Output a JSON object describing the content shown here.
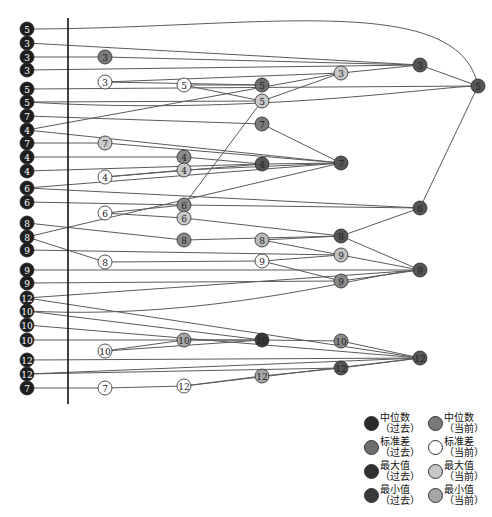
{
  "diagram": {
    "type": "tanglegram-node-link",
    "axis_line": {
      "x": 68,
      "y1": 18,
      "y2": 404
    },
    "colors": {
      "median_past": "#2b2b2b",
      "median_now": "#7a7a7a",
      "std_past": "#6e6e6e",
      "std_now": "#ffffff",
      "max_past": "#303030",
      "max_now": "#c8c8c8",
      "min_past": "#3a3a3a",
      "min_now": "#a6a6a6",
      "left_node": "#1e1e1e",
      "edge": "#5a5a5a"
    },
    "left_nodes": [
      {
        "id": "L1",
        "label": "5",
        "y": 29
      },
      {
        "id": "L2",
        "label": "3",
        "y": 43
      },
      {
        "id": "L3",
        "label": "3",
        "y": 57
      },
      {
        "id": "L4",
        "label": "3",
        "y": 70
      },
      {
        "id": "L5",
        "label": "5",
        "y": 89
      },
      {
        "id": "L6",
        "label": "5",
        "y": 102
      },
      {
        "id": "L7",
        "label": "7",
        "y": 116
      },
      {
        "id": "L8",
        "label": "4",
        "y": 130
      },
      {
        "id": "L9",
        "label": "7",
        "y": 143
      },
      {
        "id": "L10",
        "label": "4",
        "y": 157
      },
      {
        "id": "L11",
        "label": "4",
        "y": 171
      },
      {
        "id": "L12",
        "label": "6",
        "y": 188
      },
      {
        "id": "L13",
        "label": "6",
        "y": 202
      },
      {
        "id": "L14",
        "label": "8",
        "y": 223
      },
      {
        "id": "L15",
        "label": "8",
        "y": 237
      },
      {
        "id": "L16",
        "label": "9",
        "y": 250
      },
      {
        "id": "L17",
        "label": "9",
        "y": 270
      },
      {
        "id": "L18",
        "label": "9",
        "y": 283
      },
      {
        "id": "L19",
        "label": "12",
        "y": 298
      },
      {
        "id": "L20",
        "label": "10",
        "y": 311
      },
      {
        "id": "L21",
        "label": "10",
        "y": 325
      },
      {
        "id": "L22",
        "label": "10",
        "y": 340
      },
      {
        "id": "L23",
        "label": "12",
        "y": 360
      },
      {
        "id": "L24",
        "label": "12",
        "y": 374
      },
      {
        "id": "L25",
        "label": "7",
        "y": 388
      }
    ],
    "nodes": [
      {
        "id": "A1",
        "label": "3",
        "x": 105,
        "y": 57,
        "fill": "#7a7a7a"
      },
      {
        "id": "A2",
        "label": "3",
        "x": 105,
        "y": 82,
        "fill": "#ffffff"
      },
      {
        "id": "A3",
        "label": "7",
        "x": 105,
        "y": 143,
        "fill": "#c8c8c8"
      },
      {
        "id": "A4",
        "label": "4",
        "x": 105,
        "y": 177,
        "fill": "#ffffff"
      },
      {
        "id": "A5",
        "label": "6",
        "x": 105,
        "y": 213,
        "fill": "#ffffff"
      },
      {
        "id": "A6",
        "label": "8",
        "x": 105,
        "y": 262,
        "fill": "#ffffff"
      },
      {
        "id": "A7",
        "label": "10",
        "x": 105,
        "y": 351,
        "fill": "#ffffff"
      },
      {
        "id": "A8",
        "label": "7",
        "x": 105,
        "y": 388,
        "fill": "#ffffff"
      },
      {
        "id": "B1",
        "label": "5",
        "x": 184,
        "y": 85,
        "fill": "#ffffff"
      },
      {
        "id": "B2",
        "label": "4",
        "x": 184,
        "y": 157,
        "fill": "#8a8a8a"
      },
      {
        "id": "B3",
        "label": "4",
        "x": 184,
        "y": 170,
        "fill": "#c8c8c8"
      },
      {
        "id": "B4",
        "label": "6",
        "x": 184,
        "y": 205,
        "fill": "#8a8a8a"
      },
      {
        "id": "B5",
        "label": "6",
        "x": 184,
        "y": 218,
        "fill": "#c8c8c8"
      },
      {
        "id": "B6",
        "label": "8",
        "x": 184,
        "y": 240,
        "fill": "#8a8a8a"
      },
      {
        "id": "B7",
        "label": "10",
        "x": 184,
        "y": 340,
        "fill": "#a6a6a6"
      },
      {
        "id": "B8",
        "label": "12",
        "x": 184,
        "y": 386,
        "fill": "#ffffff"
      },
      {
        "id": "C1",
        "label": "5",
        "x": 262,
        "y": 85,
        "fill": "#6e6e6e"
      },
      {
        "id": "C2",
        "label": "5",
        "x": 262,
        "y": 101,
        "fill": "#c8c8c8"
      },
      {
        "id": "C3",
        "label": "7",
        "x": 262,
        "y": 124,
        "fill": "#7a7a7a"
      },
      {
        "id": "C4",
        "label": "4",
        "x": 262,
        "y": 164,
        "fill": "#555555"
      },
      {
        "id": "C5",
        "label": "8",
        "x": 262,
        "y": 240,
        "fill": "#b8b8b8"
      },
      {
        "id": "C6",
        "label": "9",
        "x": 262,
        "y": 261,
        "fill": "#ffffff"
      },
      {
        "id": "C7",
        "label": "10",
        "x": 262,
        "y": 340,
        "fill": "#3a3a3a"
      },
      {
        "id": "C8",
        "label": "12",
        "x": 262,
        "y": 376,
        "fill": "#a6a6a6"
      },
      {
        "id": "D1",
        "label": "3",
        "x": 341,
        "y": 73,
        "fill": "#c8c8c8"
      },
      {
        "id": "D2",
        "label": "7",
        "x": 341,
        "y": 163,
        "fill": "#555555"
      },
      {
        "id": "D3",
        "label": "8",
        "x": 341,
        "y": 236,
        "fill": "#555555"
      },
      {
        "id": "D4",
        "label": "9",
        "x": 341,
        "y": 255,
        "fill": "#c0c0c0"
      },
      {
        "id": "D5",
        "label": "9",
        "x": 341,
        "y": 281,
        "fill": "#8a8a8a"
      },
      {
        "id": "D6",
        "label": "10",
        "x": 341,
        "y": 341,
        "fill": "#8a8a8a"
      },
      {
        "id": "D7",
        "label": "12",
        "x": 341,
        "y": 368,
        "fill": "#555555"
      },
      {
        "id": "E1",
        "label": "3",
        "x": 420,
        "y": 65,
        "fill": "#555555"
      },
      {
        "id": "E2",
        "label": "6",
        "x": 420,
        "y": 208,
        "fill": "#555555"
      },
      {
        "id": "E3",
        "label": "9",
        "x": 420,
        "y": 270,
        "fill": "#555555"
      },
      {
        "id": "E4",
        "label": "12",
        "x": 420,
        "y": 358,
        "fill": "#555555"
      },
      {
        "id": "F1",
        "label": "5",
        "x": 478,
        "y": 86,
        "fill": "#555555"
      }
    ],
    "edges": [
      {
        "from": "L1",
        "to": "F1",
        "curve": 40
      },
      {
        "from": "L2",
        "to": "E1",
        "curve": 0
      },
      {
        "from": "L3",
        "to": "A1",
        "curve": 0
      },
      {
        "from": "A1",
        "to": "E1",
        "curve": 0
      },
      {
        "from": "L4",
        "to": "E1",
        "curve": 0
      },
      {
        "from": "A2",
        "to": "D1",
        "curve": 0
      },
      {
        "from": "A2",
        "to": "C1",
        "curve": 0
      },
      {
        "from": "B1",
        "to": "C1",
        "curve": 0
      },
      {
        "from": "B1",
        "to": "C2",
        "curve": 0
      },
      {
        "from": "D1",
        "to": "E1",
        "curve": 0
      },
      {
        "from": "C2",
        "to": "D1",
        "curve": 0
      },
      {
        "from": "L5",
        "to": "F1",
        "curve": 0
      },
      {
        "from": "E1",
        "to": "F1",
        "curve": 0
      },
      {
        "from": "L6",
        "to": "C2",
        "curve": 0
      },
      {
        "from": "L6",
        "to": "F1",
        "curve": -14
      },
      {
        "from": "L7",
        "to": "C3",
        "curve": 0
      },
      {
        "from": "C3",
        "to": "D2",
        "curve": 0
      },
      {
        "from": "L8",
        "to": "D1",
        "curve": 0
      },
      {
        "from": "L8",
        "to": "D2",
        "curve": 0
      },
      {
        "from": "L9",
        "to": "A3",
        "curve": 0
      },
      {
        "from": "A3",
        "to": "D2",
        "curve": 0
      },
      {
        "from": "L10",
        "to": "B2",
        "curve": 0
      },
      {
        "from": "B2",
        "to": "C4",
        "curve": 0
      },
      {
        "from": "L11",
        "to": "C4",
        "curve": 0
      },
      {
        "from": "A4",
        "to": "B3",
        "curve": 0
      },
      {
        "from": "A4",
        "to": "C4",
        "curve": 0
      },
      {
        "from": "B3",
        "to": "D2",
        "curve": 0
      },
      {
        "from": "C4",
        "to": "D2",
        "curve": 0
      },
      {
        "from": "L12",
        "to": "D2",
        "curve": 0
      },
      {
        "from": "L12",
        "to": "E2",
        "curve": 0
      },
      {
        "from": "L13",
        "to": "B4",
        "curve": 0
      },
      {
        "from": "B4",
        "to": "C2",
        "curve": 0
      },
      {
        "from": "B4",
        "to": "E2",
        "curve": 0
      },
      {
        "from": "A5",
        "to": "B4",
        "curve": 0
      },
      {
        "from": "A5",
        "to": "B5",
        "curve": 0
      },
      {
        "from": "B5",
        "to": "D3",
        "curve": 0
      },
      {
        "from": "E2",
        "to": "F1",
        "curve": 0
      },
      {
        "from": "L14",
        "to": "B6",
        "curve": 0
      },
      {
        "from": "B6",
        "to": "D3",
        "curve": 0
      },
      {
        "from": "L15",
        "to": "D2",
        "curve": 0
      },
      {
        "from": "L15",
        "to": "A6",
        "curve": 0
      },
      {
        "from": "C5",
        "to": "D3",
        "curve": 0
      },
      {
        "from": "C5",
        "to": "D4",
        "curve": 0
      },
      {
        "from": "D3",
        "to": "E2",
        "curve": 0
      },
      {
        "from": "D3",
        "to": "E3",
        "curve": 0
      },
      {
        "from": "L16",
        "to": "D4",
        "curve": 0
      },
      {
        "from": "A6",
        "to": "C6",
        "curve": 0
      },
      {
        "from": "C6",
        "to": "D4",
        "curve": 0
      },
      {
        "from": "C6",
        "to": "D5",
        "curve": 0
      },
      {
        "from": "D4",
        "to": "E3",
        "curve": 0
      },
      {
        "from": "L17",
        "to": "E3",
        "curve": 0
      },
      {
        "from": "L18",
        "to": "D5",
        "curve": 0
      },
      {
        "from": "D5",
        "to": "E3",
        "curve": 0
      },
      {
        "from": "L19",
        "to": "E3",
        "curve": 0
      },
      {
        "from": "L19",
        "to": "E4",
        "curve": 0
      },
      {
        "from": "L20",
        "to": "E3",
        "curve": -10
      },
      {
        "from": "L20",
        "to": "C7",
        "curve": 0
      },
      {
        "from": "L21",
        "to": "E4",
        "curve": 0
      },
      {
        "from": "L22",
        "to": "C7",
        "curve": 0
      },
      {
        "from": "A7",
        "to": "B7",
        "curve": 0
      },
      {
        "from": "A7",
        "to": "C7",
        "curve": 0
      },
      {
        "from": "B7",
        "to": "C7",
        "curve": 0
      },
      {
        "from": "C7",
        "to": "D6",
        "curve": 0
      },
      {
        "from": "D6",
        "to": "E4",
        "curve": 0
      },
      {
        "from": "L23",
        "to": "E4",
        "curve": 0
      },
      {
        "from": "L24",
        "to": "D7",
        "curve": 0
      },
      {
        "from": "L24",
        "to": "E4",
        "curve": 0
      },
      {
        "from": "D7",
        "to": "E4",
        "curve": 0
      },
      {
        "from": "C8",
        "to": "D7",
        "curve": 0
      },
      {
        "from": "B8",
        "to": "C8",
        "curve": 0
      },
      {
        "from": "B8",
        "to": "E4",
        "curve": 0
      },
      {
        "from": "L25",
        "to": "A8",
        "curve": 0
      },
      {
        "from": "A8",
        "to": "B8",
        "curve": 0
      }
    ]
  },
  "legend": {
    "items": [
      {
        "line1": "中位数",
        "line2": "（过去）",
        "color": "#2b2b2b"
      },
      {
        "line1": "中位数",
        "line2": "（当前）",
        "color": "#7a7a7a"
      },
      {
        "line1": "标准差",
        "line2": "（过去）",
        "color": "#6e6e6e"
      },
      {
        "line1": "标准差",
        "line2": "（当前）",
        "color": "#ffffff"
      },
      {
        "line1": "最大值",
        "line2": "（过去）",
        "color": "#303030"
      },
      {
        "line1": "最大值",
        "line2": "（当前）",
        "color": "#c8c8c8"
      },
      {
        "line1": "最小值",
        "line2": "（过去）",
        "color": "#3a3a3a"
      },
      {
        "line1": "最小值",
        "line2": "（当前）",
        "color": "#a6a6a6"
      }
    ]
  }
}
